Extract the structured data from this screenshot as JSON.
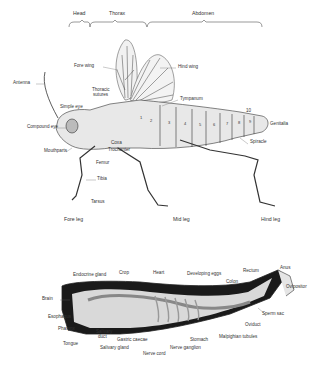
{
  "diagram": {
    "external": {
      "regions": [
        {
          "label": "Head",
          "x": 73,
          "y": 14
        },
        {
          "label": "Thorax",
          "x": 109,
          "y": 14
        },
        {
          "label": "Abdomen",
          "x": 192,
          "y": 14
        }
      ],
      "labels": [
        {
          "label": "Fore wing",
          "x": 74,
          "y": 65
        },
        {
          "label": "Hind wing",
          "x": 178,
          "y": 66
        },
        {
          "label": "Antenna",
          "x": 13,
          "y": 82
        },
        {
          "label": "Thoracic",
          "x": 92,
          "y": 89
        },
        {
          "label": "sutures",
          "x": 93,
          "y": 94
        },
        {
          "label": "Tympanum",
          "x": 180,
          "y": 98
        },
        {
          "label": "Simple eye",
          "x": 60,
          "y": 106
        },
        {
          "label": "10",
          "x": 246,
          "y": 110
        },
        {
          "label": "Genitalia",
          "x": 270,
          "y": 123
        },
        {
          "label": "Compound eye",
          "x": 27,
          "y": 126
        },
        {
          "label": "Spiracle",
          "x": 250,
          "y": 141
        },
        {
          "label": "Coxa",
          "x": 111,
          "y": 142
        },
        {
          "label": "Mouthparts",
          "x": 44,
          "y": 150
        },
        {
          "label": "Trochanter",
          "x": 108,
          "y": 149
        },
        {
          "label": "Femur",
          "x": 96,
          "y": 162
        },
        {
          "label": "Tibia",
          "x": 97,
          "y": 178
        },
        {
          "label": "Tarsus",
          "x": 91,
          "y": 201
        }
      ],
      "segment_numbers": [
        "1",
        "2",
        "3",
        "4",
        "5",
        "6",
        "7",
        "8",
        "9"
      ],
      "legs": [
        {
          "label": "Fore leg",
          "x": 64,
          "y": 219
        },
        {
          "label": "Mid leg",
          "x": 173,
          "y": 219
        },
        {
          "label": "Hind leg",
          "x": 261,
          "y": 219
        }
      ]
    },
    "internal": {
      "labels": [
        {
          "label": "Endocrine gland",
          "x": 73,
          "y": 274
        },
        {
          "label": "Crop",
          "x": 119,
          "y": 272
        },
        {
          "label": "Heart",
          "x": 153,
          "y": 272
        },
        {
          "label": "Developing eggs",
          "x": 187,
          "y": 273
        },
        {
          "label": "Rectum",
          "x": 243,
          "y": 270
        },
        {
          "label": "Anus",
          "x": 280,
          "y": 267
        },
        {
          "label": "Colon",
          "x": 226,
          "y": 281
        },
        {
          "label": "Ovipositor",
          "x": 286,
          "y": 286
        },
        {
          "label": "Brain",
          "x": 42,
          "y": 298
        },
        {
          "label": "Sperm sac",
          "x": 262,
          "y": 313
        },
        {
          "label": "Esophagus",
          "x": 48,
          "y": 316
        },
        {
          "label": "Oviduct",
          "x": 245,
          "y": 324
        },
        {
          "label": "Pharynx",
          "x": 58,
          "y": 328
        },
        {
          "label": "Salivary",
          "x": 96,
          "y": 331
        },
        {
          "label": "duct",
          "x": 98,
          "y": 336
        },
        {
          "label": "Malpighian tubules",
          "x": 219,
          "y": 336
        },
        {
          "label": "Gastric caecae",
          "x": 117,
          "y": 339
        },
        {
          "label": "Tongue",
          "x": 63,
          "y": 343
        },
        {
          "label": "Stomach",
          "x": 190,
          "y": 339
        },
        {
          "label": "Salivary gland",
          "x": 100,
          "y": 347
        },
        {
          "label": "Nerve ganglion",
          "x": 170,
          "y": 347
        },
        {
          "label": "Nerve cord",
          "x": 143,
          "y": 353
        }
      ]
    }
  },
  "colors": {
    "background": "#ffffff",
    "ink": "#333333",
    "body_fill": "#e8e8e8",
    "cavity_dark": "#1a1a1a",
    "organ_light": "#cfcfcf"
  }
}
